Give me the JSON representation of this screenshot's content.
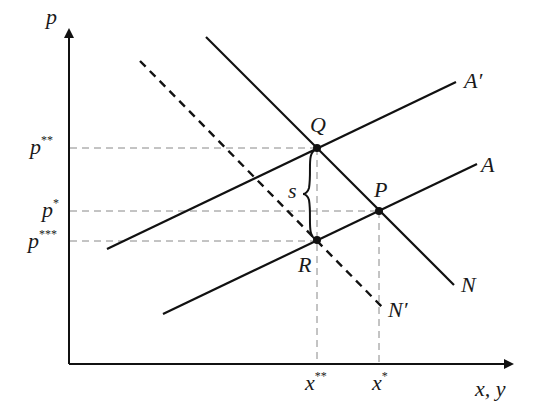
{
  "diagram": {
    "axes": {
      "y_label": "p",
      "x_label": "x, y"
    },
    "price_ticks": [
      {
        "base": "p",
        "stars": "**",
        "y": 148
      },
      {
        "base": "p",
        "stars": "*",
        "y": 211
      },
      {
        "base": "p",
        "stars": "***",
        "y": 241
      }
    ],
    "quantity_ticks": [
      {
        "base": "x",
        "stars": "**",
        "x": 317
      },
      {
        "base": "x",
        "stars": "*",
        "x": 379
      }
    ],
    "curves": [
      {
        "name": "A",
        "label": "A"
      },
      {
        "name": "A-prime",
        "label": "A′"
      },
      {
        "name": "N",
        "label": "N"
      },
      {
        "name": "N-prime",
        "label": "N′"
      }
    ],
    "points": [
      {
        "name": "Q",
        "label": "Q"
      },
      {
        "name": "P",
        "label": "P"
      },
      {
        "name": "R",
        "label": "R"
      }
    ],
    "brace_label": "s",
    "colors": {
      "line": "#111111",
      "guide": "#888888"
    }
  }
}
